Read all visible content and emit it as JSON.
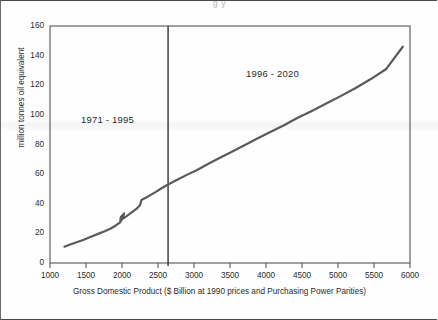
{
  "figure": {
    "cropped_title_fragment": "g                                               y",
    "background_color": "#ffffff",
    "frame_color": "#4a4a4a"
  },
  "chart_data": {
    "type": "line",
    "title": "",
    "xlabel": "Gross Domestic Product ($ Billion at 1990 prices and Purchasing Power Parities)",
    "ylabel": "million tonnes oil equivalent",
    "xlim": [
      1000,
      6000
    ],
    "ylim": [
      0,
      160
    ],
    "xticks": [
      1000,
      1500,
      2000,
      2500,
      3000,
      3500,
      4000,
      4500,
      5000,
      5500,
      6000
    ],
    "yticks": [
      0,
      20,
      40,
      60,
      80,
      100,
      120,
      140,
      160
    ],
    "xtick_labels": [
      "1000",
      "1500",
      "2000",
      "2500",
      "3000",
      "3500",
      "4000",
      "4500",
      "5000",
      "5500",
      "6000"
    ],
    "ytick_labels": [
      "0",
      "20",
      "40",
      "60",
      "80",
      "100",
      "120",
      "140",
      "160"
    ],
    "grid": false,
    "legend": null,
    "line_color": "#5a5a5a",
    "line_width": 2.2,
    "series": [
      {
        "name": "Energy consumption vs GDP",
        "x": [
          1200,
          1280,
          1370,
          1460,
          1560,
          1660,
          1760,
          1850,
          1920,
          1975,
          2010,
          2030,
          1985,
          1975,
          2000,
          2060,
          2130,
          2200,
          2250,
          2270,
          2330,
          2400,
          2470,
          2550,
          2640,
          2760,
          2900,
          3050,
          3200,
          3360,
          3520,
          3700,
          3880,
          4060,
          4250,
          4440,
          4630,
          4830,
          5030,
          5240,
          5450,
          5670,
          5900
        ],
        "y": [
          11,
          12.5,
          14,
          15.5,
          17.5,
          19.5,
          21.5,
          23.5,
          25.5,
          27.5,
          30.5,
          33.5,
          31,
          28.5,
          29.5,
          31.5,
          34,
          36.5,
          39,
          42.5,
          44,
          46,
          48,
          50.5,
          53,
          56,
          59.5,
          63,
          67,
          71,
          75,
          79.5,
          84,
          88.5,
          93,
          98,
          102.5,
          107.5,
          112.5,
          118,
          124,
          131,
          146
        ]
      }
    ],
    "annotations": [
      {
        "text": "1971 - 1995",
        "x": 1720,
        "y": 88,
        "name": "period-label-1971-1995"
      },
      {
        "text": "1996 - 2020",
        "x": 3980,
        "y": 120,
        "name": "period-label-1996-2020"
      }
    ],
    "vertical_divider": {
      "x": 2640,
      "color": "#333333",
      "width": 1.4,
      "name": "period-divider-line"
    }
  }
}
